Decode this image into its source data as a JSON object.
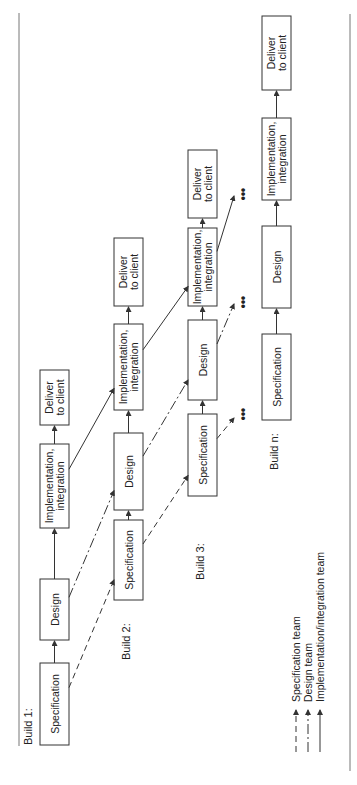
{
  "diagram": {
    "orientation": "rotated -90deg",
    "builds": [
      {
        "label": "Build 1:",
        "x": 40,
        "label_pos": {
          "x": 32,
          "y": 745
        },
        "stages": [
          {
            "id": "spec",
            "lines": [
              "Specification"
            ],
            "y1": 663,
            "y2": 745
          },
          {
            "id": "design",
            "lines": [
              "Design"
            ],
            "y1": 579,
            "y2": 640
          },
          {
            "id": "impl",
            "lines": [
              "Implementation,",
              "integration"
            ],
            "y1": 444,
            "y2": 528
          },
          {
            "id": "deliver",
            "lines": [
              "Deliver",
              "to client"
            ],
            "y1": 370,
            "y2": 425
          }
        ]
      },
      {
        "label": "Build 2:",
        "x": 114,
        "label_pos": {
          "x": 130,
          "y": 660
        },
        "stages": [
          {
            "id": "spec",
            "lines": [
              "Specification"
            ],
            "y1": 520,
            "y2": 600
          },
          {
            "id": "design",
            "lines": [
              "Design"
            ],
            "y1": 433,
            "y2": 510
          },
          {
            "id": "impl",
            "lines": [
              "Implementation,",
              "integration"
            ],
            "y1": 324,
            "y2": 410
          },
          {
            "id": "deliver",
            "lines": [
              "Deliver",
              "to client"
            ],
            "y1": 238,
            "y2": 306
          }
        ]
      },
      {
        "label": "Build 3:",
        "x": 188,
        "label_pos": {
          "x": 204,
          "y": 580
        },
        "stages": [
          {
            "id": "spec",
            "lines": [
              "Specification"
            ],
            "y1": 414,
            "y2": 496
          },
          {
            "id": "design",
            "lines": [
              "Design"
            ],
            "y1": 320,
            "y2": 400
          },
          {
            "id": "impl",
            "lines": [
              "Implementation,",
              "integration"
            ],
            "y1": 228,
            "y2": 306
          },
          {
            "id": "deliver",
            "lines": [
              "Deliver",
              "to client"
            ],
            "y1": 150,
            "y2": 218
          }
        ]
      },
      {
        "label": "Build n:",
        "x": 262,
        "label_pos": {
          "x": 278,
          "y": 470
        },
        "stages": [
          {
            "id": "spec",
            "lines": [
              "Specification"
            ],
            "y1": 334,
            "y2": 420
          },
          {
            "id": "design",
            "lines": [
              "Design"
            ],
            "y1": 226,
            "y2": 308
          },
          {
            "id": "impl",
            "lines": [
              "Implementation,",
              "integration"
            ],
            "y1": 118,
            "y2": 200
          },
          {
            "id": "deliver",
            "lines": [
              "Deliver",
              "to client"
            ],
            "y1": 16,
            "y2": 90
          }
        ]
      }
    ],
    "ellipsis": "•••",
    "legend": [
      {
        "style": "spec",
        "label": "Specification team"
      },
      {
        "style": "design",
        "label": "Design team"
      },
      {
        "style": "impl",
        "label": "Implementation/integration team"
      }
    ]
  }
}
